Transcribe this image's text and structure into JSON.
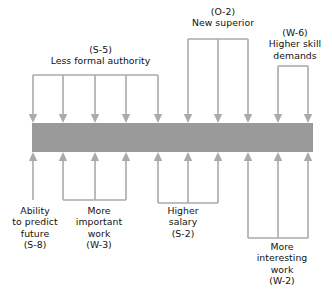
{
  "figure": {
    "type": "force-field-diagram",
    "bar": {
      "color": "#9a9a9a",
      "x": 32,
      "y": 123,
      "width": 281,
      "height": 29
    },
    "arrow_color": "#aaaaaa",
    "background": "#ffffff"
  },
  "driving_forces_top": [
    {
      "id": "S-5",
      "code": "(S-5)",
      "text": "Less formal authority",
      "label": "(S-5)\nLess formal authority",
      "direction": "down",
      "arrow_count": 5,
      "arrow_x": [
        33,
        63,
        95,
        126,
        158
      ],
      "bracket_y": 75,
      "tip_y": 123
    },
    {
      "id": "O-2",
      "code": "(O-2)",
      "text": "New superior",
      "label": "(O-2)\nNew superior",
      "direction": "down",
      "arrow_count": 3,
      "arrow_x": [
        188,
        218,
        248
      ],
      "bracket_y": 39,
      "tip_y": 123
    },
    {
      "id": "W-6",
      "code": "(W-6)",
      "text": "Higher skill demands",
      "label": "(W-6)\nHigher skill\ndemands",
      "direction": "down",
      "arrow_count": 2,
      "arrow_x": [
        278,
        308
      ],
      "bracket_y": 66,
      "tip_y": 123
    }
  ],
  "restraining_forces_bottom": [
    {
      "id": "S-8",
      "code": "(S-8)",
      "text": "Ability to predict future",
      "label": "Ability\nto predict\nfuture\n(S-8)",
      "direction": "up",
      "arrow_count": 1,
      "arrow_x": [
        33
      ],
      "bracket_y": 200,
      "tip_y": 152
    },
    {
      "id": "W-3",
      "code": "(W-3)",
      "text": "More important work",
      "label": "More\nimportant\nwork\n(W-3)",
      "direction": "up",
      "arrow_count": 3,
      "arrow_x": [
        63,
        95,
        126
      ],
      "bracket_y": 200,
      "tip_y": 152
    },
    {
      "id": "S-2",
      "code": "(S-2)",
      "text": "Higher salary",
      "label": "Higher\nsalary\n(S-2)",
      "direction": "up",
      "arrow_count": 3,
      "arrow_x": [
        158,
        188,
        218
      ],
      "bracket_y": 203,
      "tip_y": 152
    },
    {
      "id": "W-2",
      "code": "(W-2)",
      "text": "More interesting work",
      "label": "More\ninteresting\nwork\n(W-2)",
      "direction": "up",
      "arrow_count": 3,
      "arrow_x": [
        248,
        278,
        308
      ],
      "bracket_y": 238,
      "tip_y": 152
    }
  ]
}
